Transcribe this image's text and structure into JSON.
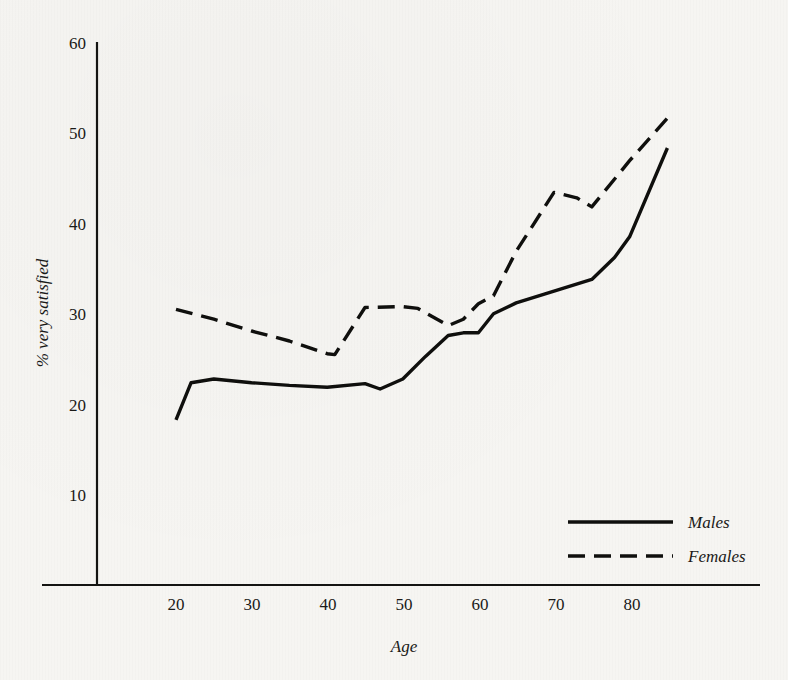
{
  "chart_data": {
    "type": "line",
    "title": "",
    "xlabel": "Age",
    "ylabel": "% very satisfied",
    "xlim": [
      15,
      88
    ],
    "ylim": [
      0,
      62
    ],
    "xticks": [
      20,
      30,
      40,
      50,
      60,
      70,
      80
    ],
    "yticks": [
      10,
      20,
      30,
      40,
      50,
      60
    ],
    "grid": false,
    "legend_position": "bottom-right",
    "series": [
      {
        "name": "Males",
        "style": "solid",
        "color": "#0f0f0d",
        "x": [
          20,
          22,
          25,
          30,
          35,
          40,
          45,
          47,
          50,
          53,
          56,
          58,
          60,
          62,
          65,
          70,
          75,
          78,
          80,
          85
        ],
        "y": [
          18.3,
          22.4,
          22.8,
          22.4,
          22.1,
          21.9,
          22.3,
          21.7,
          22.8,
          25.3,
          27.6,
          27.9,
          27.9,
          30.0,
          31.2,
          32.5,
          33.8,
          36.2,
          38.5,
          48.3
        ]
      },
      {
        "name": "Females",
        "style": "dashed",
        "color": "#0f0f0d",
        "x": [
          20,
          25,
          30,
          35,
          40,
          41,
          45,
          50,
          52,
          56,
          58,
          60,
          62,
          65,
          70,
          73,
          75,
          80,
          85
        ],
        "y": [
          30.5,
          29.4,
          28.1,
          27.0,
          25.6,
          25.5,
          30.7,
          30.8,
          30.6,
          28.7,
          29.4,
          31.1,
          32.0,
          36.9,
          43.4,
          42.8,
          41.8,
          46.9,
          51.6
        ]
      }
    ]
  },
  "legend": {
    "entries": [
      {
        "label": "Males",
        "style": "solid"
      },
      {
        "label": "Females",
        "style": "dashed"
      }
    ]
  },
  "axes": {
    "y_title": "% very satisfied",
    "x_title": "Age",
    "y_tick_labels": [
      "60",
      "50",
      "40",
      "30",
      "20",
      "10"
    ],
    "x_tick_labels": [
      "20",
      "30",
      "40",
      "50",
      "60",
      "70",
      "80"
    ]
  },
  "colors": {
    "ink": "#0f0f0d",
    "paper": "#f6f5f2"
  }
}
